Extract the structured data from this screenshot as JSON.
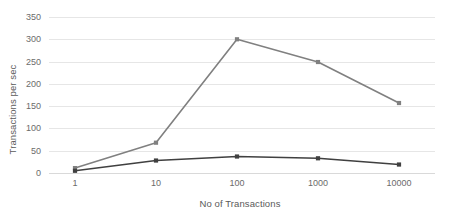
{
  "chart_data": {
    "type": "line",
    "title": "",
    "xlabel": "No of Transactions",
    "ylabel": "Transactions per sec",
    "categories": [
      "1",
      "10",
      "100",
      "1000",
      "10000"
    ],
    "x_tick_labels": [
      "1",
      "10",
      "100",
      "1000",
      "10000"
    ],
    "y_tick_labels": [
      "0",
      "50",
      "100",
      "150",
      "200",
      "250",
      "300",
      "350"
    ],
    "y_ticks": [
      0,
      50,
      100,
      150,
      200,
      250,
      300,
      350
    ],
    "ylim": [
      0,
      350
    ],
    "grid": true,
    "legend": "none",
    "series": [
      {
        "name": "series-gray",
        "color": "#808080",
        "values": [
          11,
          68,
          300,
          249,
          157
        ]
      },
      {
        "name": "series-dark",
        "color": "#404040",
        "values": [
          5,
          28,
          37,
          33,
          19
        ]
      }
    ]
  },
  "colors": {
    "background": "#ffffff",
    "gridline": "#e6e6e6",
    "baseline": "#d9d9d9",
    "tick_text": "#6b6b6b",
    "axis_title_text": "#5a5a5a",
    "series_gray": "#808080",
    "series_dark": "#404040"
  }
}
